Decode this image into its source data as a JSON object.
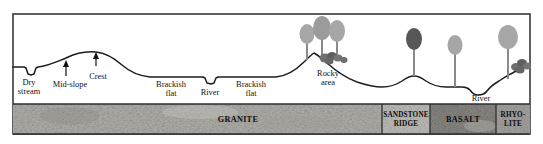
{
  "figure": {
    "type": "geological-cross-section",
    "frame": {
      "border_color": "#3a3a3a",
      "background": "#ffffff"
    }
  },
  "surface_labels": [
    {
      "id": "dry-stream",
      "text_line1": "Dry",
      "text_line2": "stream",
      "x": 29,
      "y": 84
    },
    {
      "id": "mid-slope",
      "text_line1": "Mid-slope",
      "text_line2": "",
      "x": 68,
      "y": 86
    },
    {
      "id": "crest",
      "text_line1": "Crest",
      "text_line2": "",
      "x": 97,
      "y": 78
    },
    {
      "id": "brackish-flat-left",
      "text_line1": "Brackish",
      "text_line2": "flat",
      "x": 171,
      "y": 85
    },
    {
      "id": "river-left",
      "text_line1": "River",
      "text_line2": "",
      "x": 209,
      "y": 90
    },
    {
      "id": "brackish-flat-right",
      "text_line1": "Brackish",
      "text_line2": "flat",
      "x": 250,
      "y": 85
    },
    {
      "id": "rocky-area",
      "text_line1": "Rocky",
      "text_line2": "area",
      "x": 328,
      "y": 76
    },
    {
      "id": "river-right",
      "text_line1": "River",
      "text_line2": "",
      "x": 483,
      "y": 95
    }
  ],
  "rock_units": [
    {
      "id": "granite",
      "label": "GRANITE",
      "label_lines": [
        "GRANITE"
      ],
      "x_start": 13,
      "x_end": 382,
      "fill": "#b4b2ad"
    },
    {
      "id": "sandstone-ridge",
      "label": "SANDSTONE RIDGE",
      "label_lines": [
        "SANDSTONE",
        "RIDGE"
      ],
      "x_start": 382,
      "x_end": 430,
      "fill": "#cfcdc8"
    },
    {
      "id": "basalt",
      "label": "BASALT",
      "label_lines": [
        "BASALT"
      ],
      "x_start": 430,
      "x_end": 496,
      "fill": "#a9a7a2"
    },
    {
      "id": "rhyolite",
      "label": "RHYO-LITE",
      "label_lines": [
        "RHYO-",
        "LITE"
      ],
      "x_start": 496,
      "x_end": 530,
      "fill": "#bdbbb6"
    }
  ],
  "vegetation": {
    "tree_canopy_light": "#a6a6a6",
    "tree_canopy_mid": "#8f8f8f",
    "tree_canopy_dark": "#575757",
    "trunk_color": "#8a8a8a",
    "boulder_color": "#6e6e6e",
    "count": 8
  },
  "arrows": [
    {
      "id": "mid-slope-arrow",
      "x": 66,
      "y_top": 62,
      "y_bottom": 76
    },
    {
      "id": "crest-arrow",
      "x": 96,
      "y_top": 53,
      "y_bottom": 66
    }
  ],
  "terrain": {
    "line_color": "#1d1d1d",
    "ground_top_y": 104,
    "ground_bottom_y": 134
  }
}
